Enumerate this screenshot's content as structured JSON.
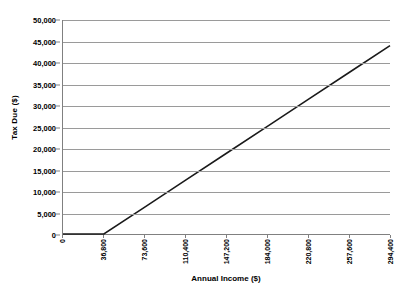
{
  "chart_data": {
    "type": "line",
    "title": "",
    "xlabel": "Annual Income ($)",
    "ylabel": "Tax Due ($)",
    "xlim": [
      0,
      294400
    ],
    "ylim": [
      0,
      50000
    ],
    "grid": "horizontal",
    "legend": "none",
    "x_tick_labels": [
      "0",
      "36,800",
      "73,600",
      "110,400",
      "147,200",
      "184,000",
      "220,800",
      "257,600",
      "294,400"
    ],
    "x_tick_values": [
      0,
      36800,
      73600,
      110400,
      147200,
      184000,
      220800,
      257600,
      294400
    ],
    "y_tick_labels": [
      "0",
      "5,000",
      "10,000",
      "15,000",
      "20,000",
      "25,000",
      "30,000",
      "35,000",
      "40,000",
      "45,000",
      "50,000"
    ],
    "y_tick_values": [
      0,
      5000,
      10000,
      15000,
      20000,
      25000,
      30000,
      35000,
      40000,
      45000,
      50000
    ],
    "series": [
      {
        "name": "Tax Due",
        "color": "#1a1a1a",
        "x": [
          0,
          36800,
          73600,
          110400,
          147200,
          184000,
          220800,
          257600,
          294400
        ],
        "y": [
          0,
          0,
          6290,
          12580,
          18870,
          25160,
          31450,
          37740,
          44000
        ]
      }
    ]
  },
  "style": {
    "gridline_color": "#9a9a9a",
    "axis_color": "#808080",
    "line_color": "#1a1a1a",
    "background": "#ffffff"
  }
}
